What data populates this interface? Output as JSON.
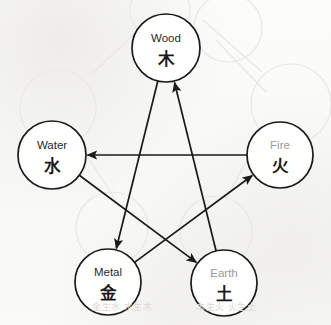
{
  "diagram": {
    "canvas": {
      "width": 331,
      "height": 325,
      "background": "#fbfbfa"
    },
    "style": {
      "circle_stroke": "#1a1a1a",
      "circle_stroke_width": 1.7,
      "circle_fill": "none",
      "edge_stroke": "#1a1a1a",
      "edge_stroke_width": 1.7,
      "label_dark": "#1a1a1a",
      "label_gray": "#9a9a9a",
      "ghost_stroke": "#ebe8e4",
      "bleed_text_color": "#ddd9d4"
    },
    "nodes": [
      {
        "id": "wood",
        "name_en": "Wood",
        "name_cn": "木",
        "cx": 166,
        "cy": 48,
        "r": 34,
        "en_color": "#2a2a2a",
        "cn_color": "#1a1a1a"
      },
      {
        "id": "water",
        "name_en": "Water",
        "name_cn": "水",
        "cx": 52,
        "cy": 155,
        "r": 34,
        "en_color": "#2a2a2a",
        "cn_color": "#1a1a1a"
      },
      {
        "id": "fire",
        "name_en": "Fire",
        "name_cn": "火",
        "cx": 280,
        "cy": 155,
        "r": 33,
        "en_color": "#9a9a9a",
        "cn_color": "#1a1a1a"
      },
      {
        "id": "metal",
        "name_en": "Metal",
        "name_cn": "金",
        "cx": 108,
        "cy": 282,
        "r": 33,
        "en_color": "#2a2a2a",
        "cn_color": "#1a1a1a"
      },
      {
        "id": "earth",
        "name_en": "Earth",
        "name_cn": "土",
        "cx": 224,
        "cy": 283,
        "r": 33,
        "en_color": "#9a9a9a",
        "cn_color": "#1a1a1a"
      }
    ],
    "edges": [
      {
        "id": "edge-wood-metal",
        "from": "wood",
        "to": "metal",
        "arrow": "to"
      },
      {
        "id": "edge-metal-fire",
        "from": "metal",
        "to": "fire",
        "arrow": "to"
      },
      {
        "id": "edge-fire-water",
        "from": "fire",
        "to": "water",
        "arrow": "to"
      },
      {
        "id": "edge-water-earth",
        "from": "water",
        "to": "earth",
        "arrow": "to"
      },
      {
        "id": "edge-earth-wood",
        "from": "earth",
        "to": "wood",
        "arrow": "to"
      }
    ],
    "ghost_circles": [
      {
        "cx": 58,
        "cy": 108,
        "r": 38
      },
      {
        "cx": 228,
        "cy": 28,
        "r": 34
      },
      {
        "cx": 291,
        "cy": 104,
        "r": 40
      },
      {
        "cx": 112,
        "cy": 228,
        "r": 36
      },
      {
        "cx": 216,
        "cy": 232,
        "r": 36
      },
      {
        "cx": 160,
        "cy": 10,
        "r": 30
      }
    ],
    "ghost_lines": [
      {
        "x1": 92,
        "y1": 74,
        "x2": 155,
        "y2": 14
      },
      {
        "x1": 203,
        "y1": 20,
        "x2": 262,
        "y2": 72
      },
      {
        "x1": 216,
        "y1": 40,
        "x2": 266,
        "y2": 92
      },
      {
        "x1": 78,
        "y1": 142,
        "x2": 120,
        "y2": 206
      },
      {
        "x1": 252,
        "y1": 150,
        "x2": 226,
        "y2": 200
      }
    ],
    "bleed_text": [
      {
        "text": "金生水 水生木",
        "x": 92,
        "y": 310
      },
      {
        "text": "木生火 火生土",
        "x": 196,
        "y": 310
      }
    ]
  }
}
